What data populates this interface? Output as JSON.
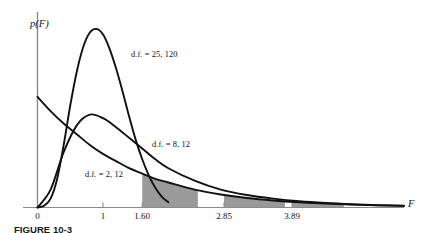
{
  "figure": {
    "caption": "FIGURE 10-3",
    "background_color": "#ffffff",
    "curve_color": "#111111",
    "axis_color": "#8a8a8a",
    "shade_color": "#9a9a9a"
  },
  "axes": {
    "y_label": "p(F)",
    "x_label": "F",
    "x_ticks": [
      {
        "label": "0",
        "value": 0
      },
      {
        "label": "1",
        "value": 1
      },
      {
        "label": "1.60",
        "value": 1.6
      },
      {
        "label": "2.85",
        "value": 2.85
      },
      {
        "label": "3.89",
        "value": 3.89
      }
    ]
  },
  "curves": [
    {
      "label": "d.f. = 25, 120",
      "df1": 25,
      "df2": 120
    },
    {
      "label": "d.f. = 8, 12",
      "df1": 8,
      "df2": 12
    },
    {
      "label": "d.f. = 2, 12",
      "df1": 2,
      "df2": 12
    }
  ],
  "shaded_regions": [
    {
      "name": "tail-region-1",
      "start": 1.6,
      "end": 2.45
    },
    {
      "name": "tail-region-2",
      "start": 2.85,
      "end": 3.78
    },
    {
      "name": "tail-region-3",
      "start": 3.89,
      "end": 4.68
    }
  ],
  "chart_data": {
    "type": "line",
    "title": "",
    "xlabel": "F",
    "ylabel": "p(F)",
    "xlim": [
      0,
      5.6
    ],
    "ylim": [
      0,
      1.05
    ],
    "grid": false,
    "legend": "inline-annotations",
    "xticks": [
      0,
      1,
      1.6,
      2.85,
      3.89
    ],
    "xticklabels": [
      "0",
      "1",
      "1.60",
      "2.85",
      "3.89"
    ],
    "series": [
      {
        "name": "d.f. = 25, 120",
        "annotation": "d.f. = 25, 120",
        "x": [
          0.0,
          0.1,
          0.2,
          0.3,
          0.4,
          0.5,
          0.6,
          0.7,
          0.8,
          0.9,
          1.0,
          1.1,
          1.2,
          1.3,
          1.4,
          1.5,
          1.6,
          1.7,
          1.8,
          1.9,
          2.0
        ],
        "y": [
          0.0,
          0.01,
          0.05,
          0.16,
          0.35,
          0.57,
          0.76,
          0.9,
          0.98,
          1.0,
          0.97,
          0.89,
          0.78,
          0.65,
          0.51,
          0.38,
          0.27,
          0.18,
          0.11,
          0.06,
          0.03
        ]
      },
      {
        "name": "d.f. = 8, 12",
        "annotation": "d.f. = 8, 12",
        "x": [
          0.0,
          0.2,
          0.4,
          0.6,
          0.8,
          1.0,
          1.2,
          1.4,
          1.6,
          1.8,
          2.0,
          2.4,
          2.8,
          3.2,
          3.6,
          4.0,
          4.4,
          4.8,
          5.2,
          5.6
        ],
        "y": [
          0.0,
          0.1,
          0.31,
          0.46,
          0.52,
          0.5,
          0.45,
          0.39,
          0.33,
          0.27,
          0.22,
          0.15,
          0.1,
          0.07,
          0.05,
          0.035,
          0.025,
          0.018,
          0.013,
          0.01
        ]
      },
      {
        "name": "d.f. = 2, 12",
        "annotation": "d.f. = 2, 12",
        "x": [
          0.0,
          0.2,
          0.4,
          0.6,
          0.8,
          1.0,
          1.2,
          1.4,
          1.6,
          1.8,
          2.0,
          2.4,
          2.8,
          3.2,
          3.6,
          4.0,
          4.4,
          4.8,
          5.2,
          5.6
        ],
        "y": [
          0.62,
          0.54,
          0.47,
          0.41,
          0.35,
          0.3,
          0.26,
          0.22,
          0.19,
          0.16,
          0.14,
          0.1,
          0.073,
          0.053,
          0.039,
          0.029,
          0.022,
          0.016,
          0.012,
          0.009
        ]
      }
    ]
  }
}
